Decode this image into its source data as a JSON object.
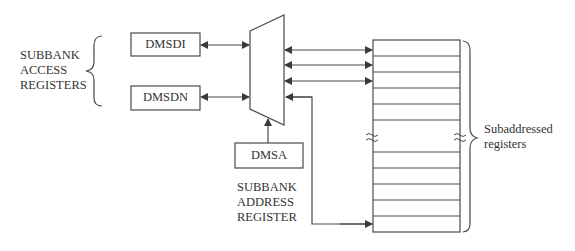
{
  "diagram": {
    "left_group_label": [
      "SUBBANK",
      "ACCESS",
      "REGISTERS"
    ],
    "boxes": {
      "dmsdi": "DMSDI",
      "dmsdn": "DMSDN",
      "dmsa": "DMSA"
    },
    "address_register_label": [
      "SUBBANK",
      "ADDRESS",
      "REGISTER"
    ],
    "right_group_label": [
      "Subaddressed",
      "registers"
    ],
    "register_rows_top": 5,
    "register_rows_bottom": 5,
    "line_color": "#4a4a4a"
  }
}
